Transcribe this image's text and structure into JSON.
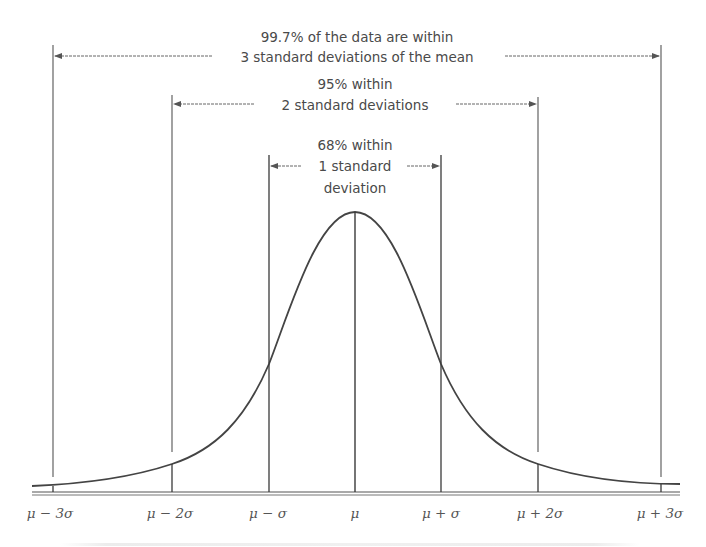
{
  "diagram": {
    "colors": {
      "line": "#3a3a3a",
      "curve": "#444444",
      "text": "#4a4a4a",
      "background": "#ffffff"
    },
    "annotations": {
      "three_sigma": {
        "line1": "99.7% of the data are within",
        "line2": "3 standard deviations of the mean"
      },
      "two_sigma": {
        "line1": "95% within",
        "line2": "2 standard deviations"
      },
      "one_sigma": {
        "line1": "68% within",
        "line2": "1 standard",
        "line3": "deviation"
      }
    },
    "axis_labels": {
      "minus3": "μ − 3σ",
      "minus2": "μ − 2σ",
      "minus1": "μ − σ",
      "mean": "μ",
      "plus1": "μ + σ",
      "plus2": "μ + 2σ",
      "plus3": "μ + 3σ"
    },
    "percentages": {
      "one_sigma": "68%",
      "two_sigma": "95%",
      "three_sigma": "99.7%"
    }
  }
}
